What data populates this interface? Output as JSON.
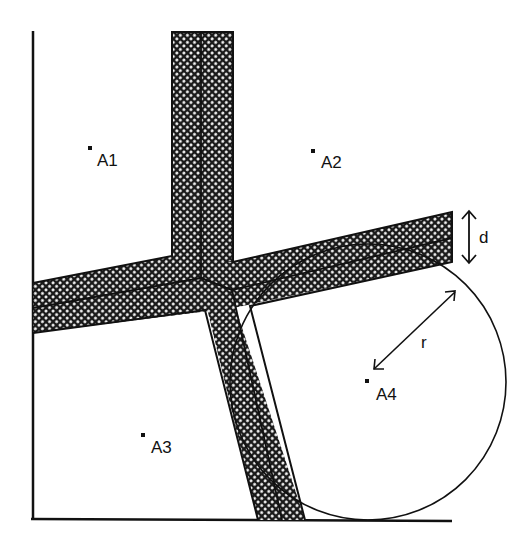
{
  "figure": {
    "type": "road-buffer-diagram",
    "colors": {
      "ink": "#111111",
      "background": "#ffffff",
      "hatch": "#222222"
    },
    "areas": [
      {
        "id": "A1",
        "label": "A1",
        "point": [
          91,
          149
        ]
      },
      {
        "id": "A2",
        "label": "A2",
        "point": [
          314,
          152
        ]
      },
      {
        "id": "A3",
        "label": "A3",
        "point": [
          144,
          436
        ]
      },
      {
        "id": "A4",
        "label": "A4",
        "point": [
          368,
          380
        ]
      }
    ],
    "annotations": {
      "width_label": "d",
      "radius_label": "r"
    },
    "circle": {
      "center": [
        368,
        382
      ],
      "radius": 138
    }
  }
}
